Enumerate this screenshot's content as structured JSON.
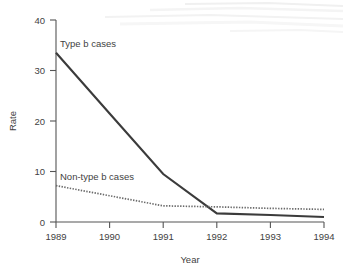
{
  "chart_data": {
    "type": "line",
    "title": "",
    "subtitle": "",
    "xlabel": "Year",
    "ylabel": "Rate",
    "x": [
      1989,
      1990,
      1991,
      1992,
      1993,
      1994
    ],
    "xtick_labels": [
      "1989",
      "1990",
      "1991",
      "1992",
      "1993",
      "1994"
    ],
    "ytick_labels": [
      "0",
      "10",
      "20",
      "30",
      "40"
    ],
    "yticks": [
      0,
      10,
      20,
      30,
      40
    ],
    "xlim": [
      1989,
      1994
    ],
    "ylim": [
      0,
      40
    ],
    "grid": false,
    "legend_position": "inline-annotations",
    "series": [
      {
        "name": "Type b cases",
        "style": "solid",
        "color": "#3b3b3b",
        "values": [
          33.5,
          21.5,
          9.5,
          1.7,
          1.4,
          1.0
        ],
        "label_x": 1989.25,
        "label_y": 37.0
      },
      {
        "name": "Non-type b cases",
        "style": "dotted",
        "color": "#6a6a6a",
        "values": [
          7.2,
          5.2,
          3.2,
          3.0,
          2.7,
          2.5
        ],
        "label_x": 1989.25,
        "label_y": 9.7
      }
    ],
    "annotations": [
      {
        "text": "Type b cases",
        "series": "Type b cases"
      },
      {
        "text": "Non-type b cases",
        "series": "Non-type b cases"
      }
    ]
  }
}
